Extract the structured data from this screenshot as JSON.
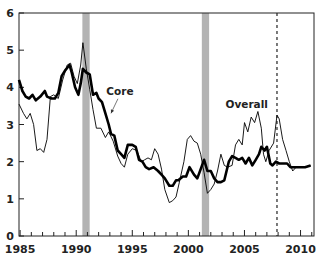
{
  "chart_data": {
    "type": "line",
    "title": "",
    "xlabel": "",
    "ylabel": "",
    "xlim": [
      1984.9,
      2011.2
    ],
    "ylim": [
      0,
      6
    ],
    "grid": false,
    "legend": "inline labels",
    "x_ticks": [
      1985,
      1990,
      1995,
      2000,
      2005,
      2010
    ],
    "x_tick_labels": [
      "1985",
      "1990",
      "1995",
      "2000",
      "2005",
      "2010"
    ],
    "x_minor_ticks": "yearly",
    "y_ticks": [
      0,
      1,
      2,
      3,
      4,
      5,
      6
    ],
    "y_tick_labels": [
      "0",
      "1",
      "2",
      "3",
      "4",
      "5",
      "6"
    ],
    "shaded_regions": [
      {
        "label": "recession",
        "start": 1990.55,
        "end": 1991.2,
        "color": "#b3b3b3"
      },
      {
        "label": "recession",
        "start": 2001.2,
        "end": 2001.85,
        "color": "#b3b3b3"
      }
    ],
    "vertical_lines": [
      {
        "x": 2007.9,
        "style": "dashed",
        "color": "#222222"
      }
    ],
    "annotations": [
      {
        "text": "Core",
        "x": 1993.9,
        "y": 3.8,
        "arrow_to": [
          1993.1,
          3.3
        ]
      },
      {
        "text": "Overall",
        "x": 2005.2,
        "y": 3.45
      }
    ],
    "series": [
      {
        "name": "Core",
        "style": "thick",
        "color": "#000000",
        "points": [
          [
            1984.9,
            4.2
          ],
          [
            1985.2,
            3.9
          ],
          [
            1985.5,
            3.75
          ],
          [
            1985.8,
            3.7
          ],
          [
            1986.1,
            3.8
          ],
          [
            1986.4,
            3.65
          ],
          [
            1986.8,
            3.75
          ],
          [
            1987.2,
            3.9
          ],
          [
            1987.4,
            3.75
          ],
          [
            1987.8,
            3.7
          ],
          [
            1988.1,
            3.7
          ],
          [
            1988.4,
            3.85
          ],
          [
            1988.7,
            4.3
          ],
          [
            1989.0,
            4.45
          ],
          [
            1989.4,
            4.6
          ],
          [
            1989.6,
            4.4
          ],
          [
            1989.9,
            4.0
          ],
          [
            1990.2,
            3.8
          ],
          [
            1990.4,
            4.1
          ],
          [
            1990.6,
            4.5
          ],
          [
            1990.9,
            4.4
          ],
          [
            1991.2,
            4.35
          ],
          [
            1991.5,
            3.8
          ],
          [
            1991.8,
            3.85
          ],
          [
            1992.0,
            3.7
          ],
          [
            1992.3,
            3.6
          ],
          [
            1992.6,
            3.3
          ],
          [
            1992.9,
            3.0
          ],
          [
            1993.1,
            2.75
          ],
          [
            1993.4,
            2.7
          ],
          [
            1993.7,
            2.3
          ],
          [
            1994.0,
            2.2
          ],
          [
            1994.3,
            2.1
          ],
          [
            1994.6,
            2.45
          ],
          [
            1995.0,
            2.45
          ],
          [
            1995.3,
            2.4
          ],
          [
            1995.6,
            2.05
          ],
          [
            1995.9,
            2.0
          ],
          [
            1996.2,
            1.85
          ],
          [
            1996.5,
            1.8
          ],
          [
            1996.9,
            1.85
          ],
          [
            1997.3,
            1.75
          ],
          [
            1997.6,
            1.65
          ],
          [
            1997.9,
            1.55
          ],
          [
            1998.3,
            1.35
          ],
          [
            1998.6,
            1.35
          ],
          [
            1998.9,
            1.5
          ],
          [
            1999.1,
            1.5
          ],
          [
            1999.5,
            1.6
          ],
          [
            1999.8,
            1.6
          ],
          [
            2000.1,
            1.85
          ],
          [
            2000.5,
            1.65
          ],
          [
            2000.8,
            1.55
          ],
          [
            2001.1,
            1.8
          ],
          [
            2001.4,
            2.05
          ],
          [
            2001.7,
            1.75
          ],
          [
            2002.0,
            1.75
          ],
          [
            2002.3,
            1.55
          ],
          [
            2002.6,
            1.45
          ],
          [
            2002.9,
            1.45
          ],
          [
            2003.2,
            1.5
          ],
          [
            2003.6,
            2.0
          ],
          [
            2003.9,
            2.15
          ],
          [
            2004.2,
            2.1
          ],
          [
            2004.5,
            2.05
          ],
          [
            2004.8,
            2.1
          ],
          [
            2005.1,
            1.95
          ],
          [
            2005.4,
            2.1
          ],
          [
            2005.7,
            1.9
          ],
          [
            2006.0,
            2.05
          ],
          [
            2006.3,
            2.2
          ],
          [
            2006.5,
            2.4
          ],
          [
            2006.8,
            2.3
          ],
          [
            2007.0,
            2.4
          ],
          [
            2007.3,
            1.95
          ],
          [
            2007.5,
            1.9
          ],
          [
            2007.8,
            2.0
          ],
          [
            2008.1,
            1.95
          ],
          [
            2008.5,
            1.95
          ],
          [
            2008.8,
            1.95
          ],
          [
            2009.1,
            1.85
          ],
          [
            2009.5,
            1.85
          ],
          [
            2009.9,
            1.85
          ],
          [
            2010.4,
            1.85
          ],
          [
            2010.9,
            1.9
          ]
        ]
      },
      {
        "name": "Overall",
        "style": "thin",
        "color": "#000000",
        "points": [
          [
            1984.9,
            3.55
          ],
          [
            1985.3,
            3.3
          ],
          [
            1985.6,
            3.15
          ],
          [
            1985.9,
            3.3
          ],
          [
            1986.2,
            3.0
          ],
          [
            1986.5,
            2.3
          ],
          [
            1986.8,
            2.35
          ],
          [
            1987.1,
            2.25
          ],
          [
            1987.4,
            2.6
          ],
          [
            1987.7,
            3.75
          ],
          [
            1988.0,
            3.8
          ],
          [
            1988.4,
            3.7
          ],
          [
            1988.8,
            4.2
          ],
          [
            1989.2,
            4.6
          ],
          [
            1989.5,
            4.65
          ],
          [
            1989.8,
            4.3
          ],
          [
            1990.1,
            4.1
          ],
          [
            1990.4,
            4.6
          ],
          [
            1990.6,
            5.2
          ],
          [
            1990.9,
            4.5
          ],
          [
            1991.2,
            3.95
          ],
          [
            1991.5,
            3.4
          ],
          [
            1991.8,
            2.9
          ],
          [
            1992.2,
            2.9
          ],
          [
            1992.6,
            2.65
          ],
          [
            1992.9,
            2.8
          ],
          [
            1993.3,
            2.55
          ],
          [
            1993.7,
            2.15
          ],
          [
            1994.0,
            1.95
          ],
          [
            1994.3,
            1.85
          ],
          [
            1994.6,
            2.2
          ],
          [
            1995.0,
            2.35
          ],
          [
            1995.4,
            2.3
          ],
          [
            1995.8,
            2.0
          ],
          [
            1996.1,
            2.05
          ],
          [
            1996.4,
            2.1
          ],
          [
            1996.7,
            2.05
          ],
          [
            1997.0,
            2.35
          ],
          [
            1997.3,
            2.2
          ],
          [
            1997.6,
            1.8
          ],
          [
            1997.9,
            1.25
          ],
          [
            1998.3,
            0.9
          ],
          [
            1998.6,
            0.95
          ],
          [
            1998.9,
            1.05
          ],
          [
            1999.2,
            1.45
          ],
          [
            1999.6,
            2.0
          ],
          [
            1999.9,
            2.6
          ],
          [
            2000.2,
            2.7
          ],
          [
            2000.5,
            2.55
          ],
          [
            2000.8,
            2.5
          ],
          [
            2001.1,
            2.2
          ],
          [
            2001.4,
            1.7
          ],
          [
            2001.7,
            1.15
          ],
          [
            2002.0,
            1.25
          ],
          [
            2002.3,
            1.4
          ],
          [
            2002.6,
            1.75
          ],
          [
            2002.9,
            2.2
          ],
          [
            2003.2,
            1.9
          ],
          [
            2003.5,
            1.85
          ],
          [
            2003.9,
            1.9
          ],
          [
            2004.2,
            2.45
          ],
          [
            2004.5,
            2.6
          ],
          [
            2004.8,
            2.45
          ],
          [
            2005.0,
            3.05
          ],
          [
            2005.3,
            2.8
          ],
          [
            2005.6,
            3.2
          ],
          [
            2005.9,
            3.05
          ],
          [
            2006.2,
            3.35
          ],
          [
            2006.5,
            2.9
          ],
          [
            2006.7,
            2.2
          ],
          [
            2006.9,
            2.0
          ],
          [
            2007.2,
            2.3
          ],
          [
            2007.6,
            2.5
          ],
          [
            2007.9,
            3.25
          ],
          [
            2008.1,
            3.15
          ],
          [
            2008.4,
            2.6
          ],
          [
            2008.7,
            2.3
          ],
          [
            2009.0,
            2.0
          ],
          [
            2009.3,
            1.75
          ],
          [
            2009.6,
            1.85
          ],
          [
            2010.0,
            1.85
          ],
          [
            2010.5,
            1.85
          ],
          [
            2010.9,
            1.9
          ]
        ]
      }
    ]
  }
}
